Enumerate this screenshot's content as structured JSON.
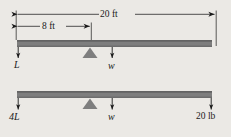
{
  "figure": {
    "background_color": "#ebe9e5",
    "beam_color": "#7f7f7f",
    "beam_edge_color": "#5f5f5f",
    "line_color": "#1a1a1a",
    "dimensions": [
      {
        "id": "overall",
        "label": "20 ft",
        "value": 20,
        "unit": "ft",
        "from_x": 16,
        "to_x": 215,
        "y": 14
      },
      {
        "id": "pivot",
        "label": "8 ft",
        "value": 8,
        "unit": "ft",
        "from_x": 16,
        "to_x": 92,
        "y": 26
      }
    ],
    "beams": [
      {
        "id": "upper-beam",
        "y": 40,
        "left_x": 17,
        "right_x": 212,
        "fulcrum_x": 90,
        "forces": [
          {
            "id": "upper-left-force",
            "label": "L",
            "x": 18,
            "direction": "down"
          },
          {
            "id": "upper-weight-force",
            "label": "w",
            "x": 112,
            "direction": "down"
          }
        ]
      },
      {
        "id": "lower-beam",
        "y": 91,
        "left_x": 17,
        "right_x": 212,
        "fulcrum_x": 90,
        "forces": [
          {
            "id": "lower-left-force",
            "label": "4L",
            "x": 18,
            "direction": "down"
          },
          {
            "id": "lower-weight-force",
            "label": "w",
            "x": 112,
            "direction": "down"
          },
          {
            "id": "lower-right-force",
            "label": "20 lb",
            "x": 211,
            "direction": "down"
          }
        ]
      }
    ],
    "labels": {
      "dim_overall": "20 ft",
      "dim_pivot": "8 ft",
      "upper_left": "L",
      "upper_weight": "w",
      "lower_left": "4L",
      "lower_weight": "w",
      "lower_right": "20 lb"
    }
  }
}
